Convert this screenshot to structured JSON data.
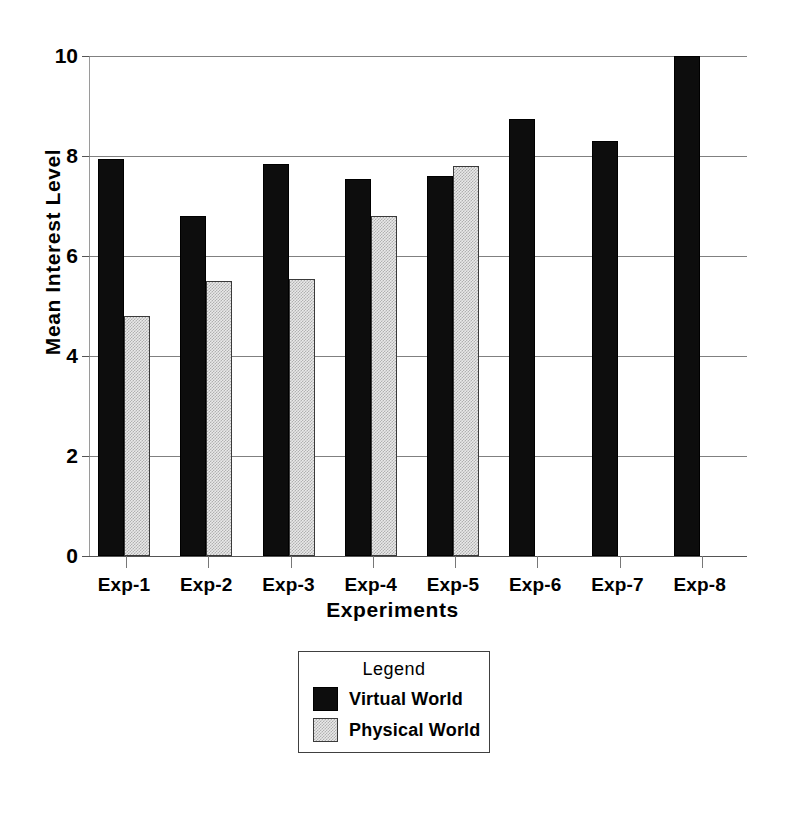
{
  "chart_data": {
    "type": "bar",
    "title": "",
    "xlabel": "Experiments",
    "ylabel": "Mean Interest Level",
    "categories": [
      "Exp-1",
      "Exp-2",
      "Exp-3",
      "Exp-4",
      "Exp-5",
      "Exp-6",
      "Exp-7",
      "Exp-8"
    ],
    "series": [
      {
        "name": "Virtual World",
        "color": "#0d0d0d",
        "values": [
          7.95,
          6.8,
          7.85,
          7.55,
          7.6,
          8.75,
          8.3,
          10.0
        ]
      },
      {
        "name": "Physical World",
        "color": "#c8c8c8",
        "values": [
          4.8,
          5.5,
          5.55,
          6.8,
          7.8,
          null,
          null,
          null
        ]
      }
    ],
    "ylim": [
      0,
      10
    ],
    "yticks": [
      0,
      2,
      4,
      6,
      8,
      10
    ],
    "ytick_labels": [
      "0",
      "2",
      "4",
      "6",
      "8",
      "10"
    ],
    "grid": true,
    "legend_position": "below-axes",
    "legend_title": "Legend"
  },
  "legend": {
    "title": "Legend",
    "entries": [
      {
        "label": "Virtual World",
        "swatch": "virtual"
      },
      {
        "label": "Physical World",
        "swatch": "physical"
      }
    ]
  }
}
